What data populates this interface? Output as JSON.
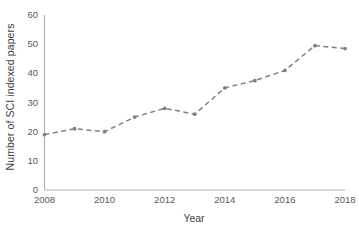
{
  "chart_data": {
    "type": "line",
    "title": "",
    "xlabel": "Year",
    "ylabel": "Number of SCI indexed papers",
    "x": [
      2008,
      2009,
      2010,
      2011,
      2012,
      2013,
      2014,
      2015,
      2016,
      2017,
      2018
    ],
    "values": [
      19,
      21,
      20,
      25,
      28,
      26,
      35,
      37.5,
      41,
      49.5,
      48.5
    ],
    "series": [
      {
        "name": "Number of SCI indexed papers",
        "values": [
          19,
          21,
          20,
          25,
          28,
          26,
          35,
          37.5,
          41,
          49.5,
          48.5
        ]
      }
    ],
    "xlim": [
      2008,
      2018
    ],
    "ylim": [
      0,
      60
    ],
    "xticks": [
      "2008",
      "2010",
      "2012",
      "2014",
      "2016",
      "2018"
    ],
    "xtick_values": [
      2008,
      2010,
      2012,
      2014,
      2016,
      2018
    ],
    "yticks": [
      "0",
      "10",
      "20",
      "30",
      "40",
      "50",
      "60"
    ],
    "ytick_values": [
      0,
      10,
      20,
      30,
      40,
      50,
      60
    ],
    "grid": false,
    "legend": null,
    "line_style": "dashed",
    "marker": "circle",
    "line_color": "#808080",
    "marker_color": "#808080",
    "axis_color": "#b0b0b0",
    "background_color": "#ffffff"
  }
}
